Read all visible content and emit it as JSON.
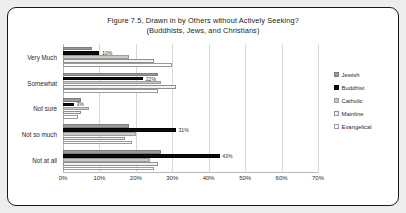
{
  "chart_data": {
    "type": "bar",
    "orientation": "horizontal",
    "title": "Figure 7.5, Drawn in by Others without Actively Seeking?",
    "subtitle": "(Buddhists, Jews, and Christians)",
    "xlabel": "",
    "ylabel": "",
    "xlim": [
      0,
      70
    ],
    "xticks": [
      "0%",
      "10%",
      "20%",
      "30%",
      "40%",
      "50%",
      "60%",
      "70%"
    ],
    "xtick_values": [
      0,
      10,
      20,
      30,
      40,
      50,
      60,
      70
    ],
    "grid": true,
    "legend_position": "right",
    "categories": [
      "Very Much",
      "Somewhat",
      "Not sure",
      "Not so much",
      "Not at all"
    ],
    "series": [
      {
        "name": "Jewish",
        "color": "#9a9a9a",
        "values": [
          8,
          26,
          5,
          18,
          27
        ],
        "labels": [
          "",
          "",
          "",
          "",
          ""
        ]
      },
      {
        "name": "Buddhist",
        "color": "#0d0d0d",
        "values": [
          10,
          22,
          3,
          31,
          43
        ],
        "labels": [
          "10%",
          "22%",
          "3%",
          "31%",
          "43%"
        ]
      },
      {
        "name": "Catholic",
        "color": "#c9c9c9",
        "values": [
          18,
          27,
          7,
          20,
          24
        ],
        "labels": [
          "",
          "",
          "",
          "",
          ""
        ]
      },
      {
        "name": "Mainline",
        "color": "#f2f2f2",
        "values": [
          25,
          31,
          5,
          17,
          26
        ],
        "labels": [
          "",
          "",
          "",
          "",
          ""
        ]
      },
      {
        "name": "Evangelical",
        "color": "#fdfdfd",
        "values": [
          30,
          26,
          4,
          19,
          25
        ],
        "labels": [
          "",
          "",
          "",
          "",
          ""
        ]
      }
    ]
  }
}
